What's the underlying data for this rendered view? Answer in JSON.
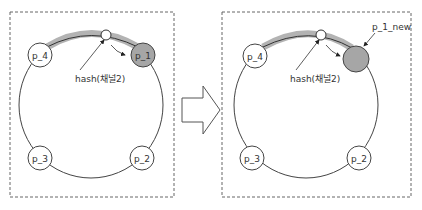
{
  "colors": {
    "stroke": "#444444",
    "highlight_arc": "#b3b3b3",
    "moved_node_fill": "#a6a6a6",
    "node_fill": "#ffffff",
    "dashed_border": "#666666"
  },
  "before": {
    "nodes": [
      {
        "id": "p_4",
        "label": "p_4"
      },
      {
        "id": "p_1",
        "label": "p_1"
      },
      {
        "id": "p_3",
        "label": "p_3"
      },
      {
        "id": "p_2",
        "label": "p_2"
      }
    ],
    "hash_label": "hash(채널2)"
  },
  "transition_arrow": "right-arrow",
  "after": {
    "nodes": [
      {
        "id": "p_4",
        "label": "p_4"
      },
      {
        "id": "p_1_new",
        "label": ""
      },
      {
        "id": "p_3",
        "label": "p_3"
      },
      {
        "id": "p_2",
        "label": "p_2"
      }
    ],
    "hash_label": "hash(채널2)",
    "new_node_callout": "p_1_new"
  }
}
